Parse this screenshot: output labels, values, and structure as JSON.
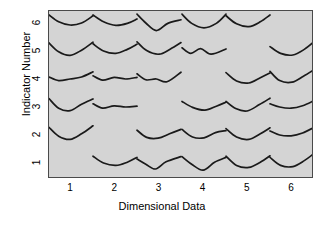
{
  "chart_data": {
    "type": "scatter",
    "glyph": "curve-glyph",
    "title": "",
    "xlabel": "Dimensional Data",
    "ylabel": "Indicator Number",
    "x_tick_labels": [
      "1",
      "2",
      "3",
      "4",
      "5",
      "6"
    ],
    "y_tick_labels": [
      "1",
      "2",
      "3",
      "4",
      "5",
      "6"
    ],
    "x": [
      1,
      2,
      3,
      4,
      5,
      6
    ],
    "y": [
      1,
      2,
      3,
      4,
      5,
      6
    ],
    "xlim": [
      0.5,
      6.5
    ],
    "ylim": [
      0.5,
      6.5
    ],
    "grid": false,
    "legend": "none",
    "panel_color": "#d4d4d4",
    "line_color": "#1a1a1a",
    "frame_color": "#4a4a4a",
    "note": "6x6 lattice of small curve glyphs; the anti-diagonal cell (row 7-col) is empty in each row",
    "cells": [
      {
        "row": 6,
        "col": 1,
        "present": true,
        "shape": "u-shallow",
        "points": [
          0.0,
          0.1,
          0.22,
          0.44,
          0.48,
          0.6,
          0.74,
          0.5,
          1.0,
          0.14
        ]
      },
      {
        "row": 6,
        "col": 2,
        "present": true,
        "shape": "u-tilted",
        "points": [
          0.0,
          0.1,
          0.24,
          0.44,
          0.52,
          0.62,
          0.78,
          0.52,
          1.0,
          0.3
        ]
      },
      {
        "row": 6,
        "col": 3,
        "present": true,
        "shape": "v-deep",
        "points": [
          0.0,
          0.06,
          0.2,
          0.5,
          0.44,
          0.88,
          0.7,
          0.52,
          1.0,
          0.34
        ]
      },
      {
        "row": 6,
        "col": 4,
        "present": true,
        "shape": "u-round",
        "points": [
          0.0,
          0.06,
          0.22,
          0.52,
          0.5,
          0.74,
          0.78,
          0.52,
          1.0,
          0.06
        ]
      },
      {
        "row": 6,
        "col": 5,
        "present": true,
        "shape": "u-narrow",
        "points": [
          0.0,
          0.14,
          0.24,
          0.54,
          0.52,
          0.68,
          0.78,
          0.44,
          1.0,
          0.1
        ]
      },
      {
        "row": 6,
        "col": 6,
        "present": false,
        "shape": "",
        "points": []
      },
      {
        "row": 5,
        "col": 1,
        "present": true,
        "shape": "u-round",
        "points": [
          0.0,
          0.1,
          0.22,
          0.54,
          0.48,
          0.72,
          0.74,
          0.46,
          1.0,
          0.06
        ]
      },
      {
        "row": 5,
        "col": 2,
        "present": true,
        "shape": "u-shallow",
        "points": [
          0.0,
          0.14,
          0.24,
          0.5,
          0.52,
          0.62,
          0.78,
          0.42,
          1.0,
          0.16
        ]
      },
      {
        "row": 5,
        "col": 3,
        "present": true,
        "shape": "u-rising",
        "points": [
          0.0,
          0.04,
          0.22,
          0.48,
          0.5,
          0.66,
          0.76,
          0.4,
          1.0,
          0.08
        ]
      },
      {
        "row": 5,
        "col": 4,
        "present": true,
        "shape": "w-wave",
        "points": [
          0.0,
          0.34,
          0.2,
          0.62,
          0.42,
          0.38,
          0.66,
          0.66,
          1.0,
          0.4
        ]
      },
      {
        "row": 5,
        "col": 5,
        "present": false,
        "shape": "",
        "points": []
      },
      {
        "row": 5,
        "col": 6,
        "present": true,
        "shape": "u-wide",
        "points": [
          0.0,
          0.28,
          0.24,
          0.62,
          0.52,
          0.7,
          0.78,
          0.42,
          1.0,
          0.04
        ]
      },
      {
        "row": 4,
        "col": 1,
        "present": true,
        "shape": "flat-wave",
        "points": [
          0.0,
          0.4,
          0.22,
          0.58,
          0.48,
          0.5,
          0.74,
          0.4,
          1.0,
          0.14
        ]
      },
      {
        "row": 4,
        "col": 2,
        "present": true,
        "shape": "flat-wave",
        "points": [
          0.0,
          0.34,
          0.22,
          0.56,
          0.48,
          0.42,
          0.74,
          0.5,
          1.0,
          0.42
        ]
      },
      {
        "row": 4,
        "col": 3,
        "present": true,
        "shape": "u-asym",
        "points": [
          0.0,
          0.24,
          0.2,
          0.54,
          0.44,
          0.5,
          0.68,
          0.64,
          1.0,
          0.16
        ]
      },
      {
        "row": 4,
        "col": 4,
        "present": false,
        "shape": "",
        "points": []
      },
      {
        "row": 4,
        "col": 5,
        "present": true,
        "shape": "u-round",
        "points": [
          0.0,
          0.18,
          0.24,
          0.6,
          0.52,
          0.7,
          0.78,
          0.44,
          1.0,
          0.2
        ]
      },
      {
        "row": 4,
        "col": 6,
        "present": true,
        "shape": "u-rising",
        "points": [
          0.0,
          0.12,
          0.22,
          0.58,
          0.5,
          0.66,
          0.76,
          0.36,
          1.0,
          0.04
        ]
      },
      {
        "row": 3,
        "col": 1,
        "present": true,
        "shape": "u-rising",
        "points": [
          0.0,
          0.08,
          0.22,
          0.56,
          0.48,
          0.68,
          0.74,
          0.36,
          1.0,
          0.1
        ]
      },
      {
        "row": 3,
        "col": 2,
        "present": true,
        "shape": "flat-wave",
        "points": [
          0.0,
          0.34,
          0.22,
          0.56,
          0.48,
          0.44,
          0.74,
          0.5,
          1.0,
          0.46
        ]
      },
      {
        "row": 3,
        "col": 3,
        "present": false,
        "shape": "",
        "points": []
      },
      {
        "row": 3,
        "col": 4,
        "present": true,
        "shape": "u-shallow",
        "points": [
          0.0,
          0.22,
          0.24,
          0.52,
          0.52,
          0.66,
          0.78,
          0.46,
          1.0,
          0.26
        ]
      },
      {
        "row": 3,
        "col": 5,
        "present": true,
        "shape": "u-rising",
        "points": [
          0.0,
          0.22,
          0.22,
          0.58,
          0.48,
          0.7,
          0.76,
          0.38,
          1.0,
          0.06
        ]
      },
      {
        "row": 3,
        "col": 6,
        "present": true,
        "shape": "flat-wave",
        "points": [
          0.0,
          0.34,
          0.22,
          0.5,
          0.48,
          0.56,
          0.74,
          0.44,
          1.0,
          0.18
        ]
      },
      {
        "row": 2,
        "col": 1,
        "present": true,
        "shape": "u-round",
        "points": [
          0.0,
          0.12,
          0.22,
          0.56,
          0.48,
          0.72,
          0.74,
          0.44,
          1.0,
          0.04
        ]
      },
      {
        "row": 2,
        "col": 2,
        "present": false,
        "shape": "",
        "points": []
      },
      {
        "row": 2,
        "col": 3,
        "present": true,
        "shape": "u-asym",
        "points": [
          0.0,
          0.26,
          0.22,
          0.62,
          0.48,
          0.66,
          0.74,
          0.44,
          1.0,
          0.22
        ]
      },
      {
        "row": 2,
        "col": 4,
        "present": true,
        "shape": "u-narrow",
        "points": [
          0.0,
          0.22,
          0.24,
          0.6,
          0.5,
          0.64,
          0.76,
          0.38,
          1.0,
          0.28
        ]
      },
      {
        "row": 2,
        "col": 5,
        "present": true,
        "shape": "u-round",
        "points": [
          0.0,
          0.18,
          0.24,
          0.6,
          0.52,
          0.72,
          0.78,
          0.44,
          1.0,
          0.14
        ]
      },
      {
        "row": 2,
        "col": 6,
        "present": true,
        "shape": "flat-wave",
        "points": [
          0.0,
          0.3,
          0.22,
          0.5,
          0.48,
          0.54,
          0.74,
          0.4,
          1.0,
          0.12
        ]
      },
      {
        "row": 1,
        "col": 1,
        "present": false,
        "shape": "",
        "points": []
      },
      {
        "row": 1,
        "col": 2,
        "present": true,
        "shape": "u-shallow",
        "points": [
          0.0,
          0.16,
          0.24,
          0.5,
          0.52,
          0.62,
          0.78,
          0.46,
          1.0,
          0.22
        ]
      },
      {
        "row": 1,
        "col": 3,
        "present": true,
        "shape": "v-deep",
        "points": [
          0.0,
          0.3,
          0.2,
          0.56,
          0.42,
          0.8,
          0.66,
          0.44,
          1.0,
          0.18
        ]
      },
      {
        "row": 1,
        "col": 4,
        "present": true,
        "shape": "v-deep",
        "points": [
          0.0,
          0.18,
          0.22,
          0.56,
          0.48,
          0.86,
          0.74,
          0.46,
          1.0,
          0.22
        ]
      },
      {
        "row": 1,
        "col": 5,
        "present": true,
        "shape": "u-round",
        "points": [
          0.0,
          0.16,
          0.24,
          0.62,
          0.52,
          0.72,
          0.78,
          0.46,
          1.0,
          0.14
        ]
      },
      {
        "row": 1,
        "col": 6,
        "present": true,
        "shape": "u-rising",
        "points": [
          0.0,
          0.22,
          0.24,
          0.62,
          0.52,
          0.68,
          0.78,
          0.38,
          1.0,
          0.02
        ]
      }
    ]
  }
}
